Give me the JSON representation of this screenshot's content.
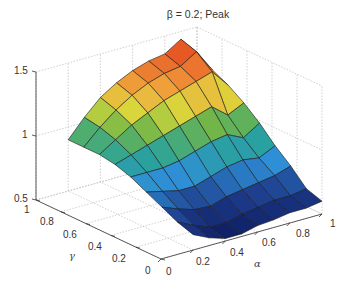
{
  "chart_data": {
    "type": "surface3d",
    "title": "β = 0.2; Peak",
    "xlabel": "α",
    "ylabel": "γ",
    "zlabel": "",
    "x_ticks": [
      "0",
      "0.2",
      "0.4",
      "0.6",
      "0.8",
      "1"
    ],
    "y_ticks": [
      "0",
      "0.2",
      "0.4",
      "0.6",
      "0.8",
      "1"
    ],
    "z_ticks": [
      "0.5",
      "1",
      "1.5"
    ],
    "xlim": [
      0,
      1
    ],
    "ylim": [
      0,
      1
    ],
    "zlim": [
      0.5,
      1.5
    ],
    "grid": true,
    "colormap": "jet",
    "x": [
      0.2,
      0.3,
      0.4,
      0.5,
      0.6,
      0.7,
      0.8,
      0.9,
      1.0
    ],
    "y": [
      0.0,
      0.125,
      0.25,
      0.375,
      0.5,
      0.625,
      0.75,
      0.875,
      1.0
    ],
    "z": [
      [
        0.62,
        0.56,
        0.52,
        0.52,
        0.55,
        0.56,
        0.58,
        0.58,
        0.6
      ],
      [
        0.66,
        0.6,
        0.55,
        0.55,
        0.58,
        0.6,
        0.62,
        0.62,
        0.64
      ],
      [
        0.72,
        0.67,
        0.63,
        0.62,
        0.66,
        0.68,
        0.7,
        0.72,
        0.76
      ],
      [
        0.78,
        0.75,
        0.72,
        0.72,
        0.76,
        0.8,
        0.82,
        0.8,
        0.86
      ],
      [
        0.84,
        0.84,
        0.84,
        0.86,
        0.9,
        0.94,
        0.96,
        0.9,
        0.98
      ],
      [
        0.88,
        0.92,
        0.96,
        1.0,
        1.04,
        1.08,
        1.12,
        1.02,
        1.08
      ],
      [
        0.9,
        0.98,
        1.06,
        1.12,
        1.18,
        1.22,
        1.26,
        1.3,
        1.16
      ],
      [
        0.9,
        1.02,
        1.12,
        1.2,
        1.26,
        1.3,
        1.32,
        1.4,
        1.22
      ],
      [
        0.9,
        1.04,
        1.16,
        1.24,
        1.3,
        1.34,
        1.36,
        1.44,
        1.24
      ]
    ]
  }
}
